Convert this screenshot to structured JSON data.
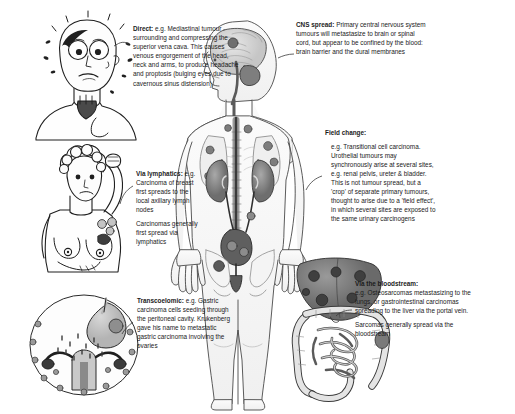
{
  "figure": {
    "background": "#ffffff",
    "ink": "#1b1b1b"
  },
  "notes": {
    "direct": {
      "heading": "Direct:",
      "body": "e.g. Mediastinal tumour surrounding and compressing the superior vena cava. This causes venous engorgement of the head, neck and arms, to produce headache and proptosis (bulging eyes due to cavernous sinus distension)"
    },
    "cns": {
      "heading": "CNS spread:",
      "body": "Primary central nervous system tumours will metastasize to brain or spinal cord, but appear to be confined by the blood: brain barrier and the dural membranes"
    },
    "field": {
      "heading": "Field change:",
      "body": "e.g. Transitional cell carcinoma. Urothelial tumours may synchronously arise at several sites, e.g. renal pelvis, ureter & bladder. This is not tumour spread, but a 'crop' of separate primary tumours, thought to arise due to a 'field effect', in which several sites are exposed to the same urinary carcinogens"
    },
    "lymphatics": {
      "heading": "Via lymphatics:",
      "body": "e.g. Carcinoma of breast first spreads to the local axillary lymph nodes",
      "body2": "Carcinomas generally first spread via lymphatics"
    },
    "transcoelomic": {
      "heading": "Transcoelomic:",
      "body": "e.g. Gastric carcinoma cells seeding through the peritoneal cavity. Krukenberg gave his name to metastatic gastric carcinoma involving the ovaries"
    },
    "bloodstream": {
      "heading": "Via the bloodstream:",
      "body": "e.g. Osteosarcomas metastasizing to the lungs, or gastrointestinal carcinomas spreading to the liver via the portal vein.",
      "body2": "Sarcomas generally spread via the bloodstream"
    }
  },
  "illustrations": {
    "head_svc": "cartoon-face-with-proptosis-and-distended-neck-veins",
    "breast": "woman-with-raised-arm-breast-tumour-and-axillary-nodes",
    "peritoneum": "peritoneal-cavity-with-stomach-uterus-and-ovaries",
    "cns": "head-profile-with-brain-and-spinal-cord",
    "torso": "torso-with-lungs-kidneys-ureters-and-bladder",
    "abdomen": "liver-with-metastases-and-bowel"
  }
}
